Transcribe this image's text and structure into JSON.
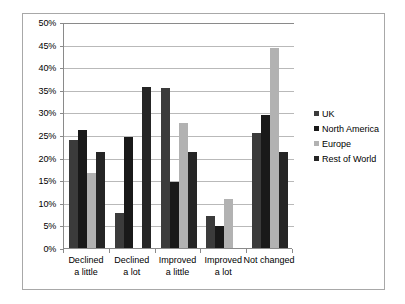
{
  "chart_data": {
    "type": "bar",
    "title": "",
    "subtitle": "",
    "xlabel": "",
    "ylabel": "",
    "ylim": [
      0,
      50
    ],
    "ytick_step": 5,
    "grid": true,
    "legend_position": "right",
    "categories": [
      "Declined\na little",
      "Declined\na lot",
      "Improved\na little",
      "Improved\na lot",
      "Not changed"
    ],
    "category_lines": [
      [
        "Declined",
        "a little"
      ],
      [
        "Declined",
        "a lot"
      ],
      [
        "Improved",
        "a little"
      ],
      [
        "Improved",
        "a lot"
      ],
      [
        "Not changed",
        ""
      ]
    ],
    "ytick_labels": [
      "0%",
      "5%",
      "10%",
      "15%",
      "20%",
      "25%",
      "30%",
      "35%",
      "40%",
      "45%",
      "50%"
    ],
    "ytick_values": [
      0,
      5,
      10,
      15,
      20,
      25,
      30,
      35,
      40,
      45,
      50
    ],
    "series": [
      {
        "name": "UK",
        "color": "#3b3b3b",
        "values": [
          24.0,
          7.7,
          35.4,
          7.0,
          25.4
        ]
      },
      {
        "name": "North America",
        "color": "#191919",
        "values": [
          26.0,
          24.5,
          14.7,
          4.9,
          29.4
        ]
      },
      {
        "name": "Europe",
        "color": "#b2b2b2",
        "values": [
          16.5,
          0.0,
          27.6,
          10.9,
          44.3
        ]
      },
      {
        "name": "Rest of World",
        "color": "#252525",
        "values": [
          21.3,
          35.6,
          21.3,
          0.0,
          21.3
        ]
      }
    ]
  },
  "style": {
    "plot_border_color": "#8a8a8a",
    "gridline_color": "#b9b9b9",
    "figure_border_color": "#a8a8a8",
    "background": "#ffffff",
    "text_color": "#000000"
  }
}
